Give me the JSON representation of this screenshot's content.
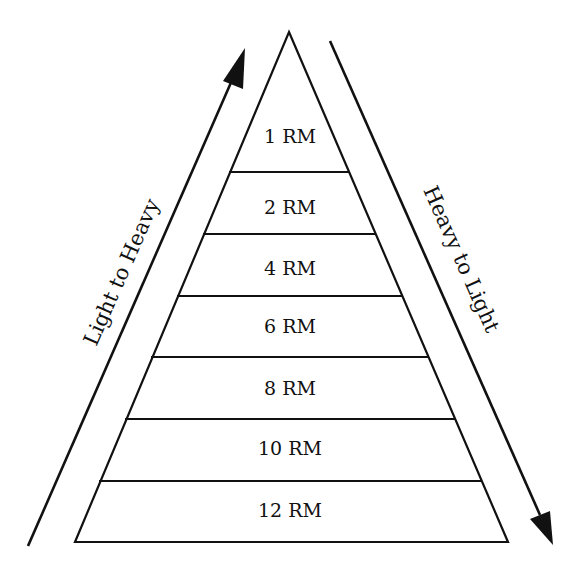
{
  "diagram": {
    "type": "pyramid",
    "stroke_color": "#111111",
    "background": "#ffffff",
    "left_arrow_label": "Light to Heavy",
    "right_arrow_label": "Heavy to Light",
    "levels": [
      {
        "label": "1 RM"
      },
      {
        "label": "2 RM"
      },
      {
        "label": "4 RM"
      },
      {
        "label": "6 RM"
      },
      {
        "label": "8 RM"
      },
      {
        "label": "10 RM"
      },
      {
        "label": "12 RM"
      }
    ]
  }
}
